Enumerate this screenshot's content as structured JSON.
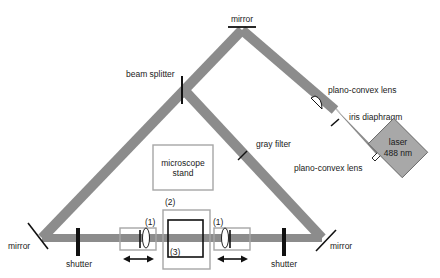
{
  "diagram": {
    "type": "optical setup schematic",
    "colors": {
      "beam": "#8c8c8c",
      "component_box": "#a6a6a6",
      "laser_fill": "#a8a8a8",
      "ink": "#111111",
      "background": "#ffffff"
    },
    "labels": {
      "mirror_top": "mirror",
      "mirror_left": "mirror",
      "mirror_right": "mirror",
      "beam_splitter": "beam splitter",
      "plano_convex_lens_1": "plano-convex lens",
      "iris_diaphragm": "iris diaphragm",
      "plano_convex_lens_2": "plano-convex lens",
      "laser_line1": "laser",
      "laser_line2": "488 nm",
      "gray_filter": "gray filter",
      "microscope_line1": "microscope",
      "microscope_line2": "stand",
      "shutter_left": "shutter",
      "shutter_right": "shutter",
      "marker_1_left": "(1)",
      "marker_1_right": "(1)",
      "marker_2": "(2)",
      "marker_3": "(3)"
    }
  }
}
